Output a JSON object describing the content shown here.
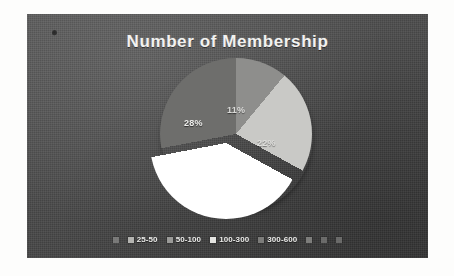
{
  "page": {
    "background_color": "#fdfdfc",
    "panel_color": "#4a4a4a"
  },
  "chart_data": {
    "type": "pie",
    "title": "Number of Membership",
    "xlabel": "",
    "ylabel": "",
    "grid": false,
    "legend_position": "bottom",
    "exploded_slice_index": 2,
    "categories": [
      "25-50",
      "50-100",
      "100-300",
      "300-600"
    ],
    "values": [
      11,
      22,
      39,
      28
    ],
    "data_labels": [
      "11%",
      "22%",
      "",
      "28%"
    ],
    "colors": [
      "#8e8e8c",
      "#c9c9c6",
      "#ffffff",
      "#6e6e6c"
    ],
    "slices": [
      {
        "label": "25-50",
        "percent": 11,
        "display": "11%",
        "color": "#8e8e8c",
        "exploded": false
      },
      {
        "label": "50-100",
        "percent": 22,
        "display": "22%",
        "color": "#c9c9c6",
        "exploded": false
      },
      {
        "label": "100-300",
        "percent": 39,
        "display": "",
        "color": "#ffffff",
        "exploded": true
      },
      {
        "label": "300-600",
        "percent": 28,
        "display": "28%",
        "color": "#6e6e6c",
        "exploded": false
      }
    ]
  },
  "title": {
    "text": "Number of Membership"
  },
  "labels": {
    "slice_1": "11%",
    "slice_2": "22%",
    "slice_4": "28%"
  },
  "legend": {
    "items": [
      {
        "label": "",
        "color": "#9a9a98"
      },
      {
        "label": "25-50",
        "color": "#b4b4b1"
      },
      {
        "label": "50-100",
        "color": "#9a9a98"
      },
      {
        "label": "100-300",
        "color": "#e4e4e1"
      },
      {
        "label": "300-600",
        "color": "#7c7c7a"
      },
      {
        "label": "",
        "color": "#a6a6a4"
      },
      {
        "label": "",
        "color": "#8a8a88"
      },
      {
        "label": "",
        "color": "#8a8a88"
      }
    ]
  }
}
